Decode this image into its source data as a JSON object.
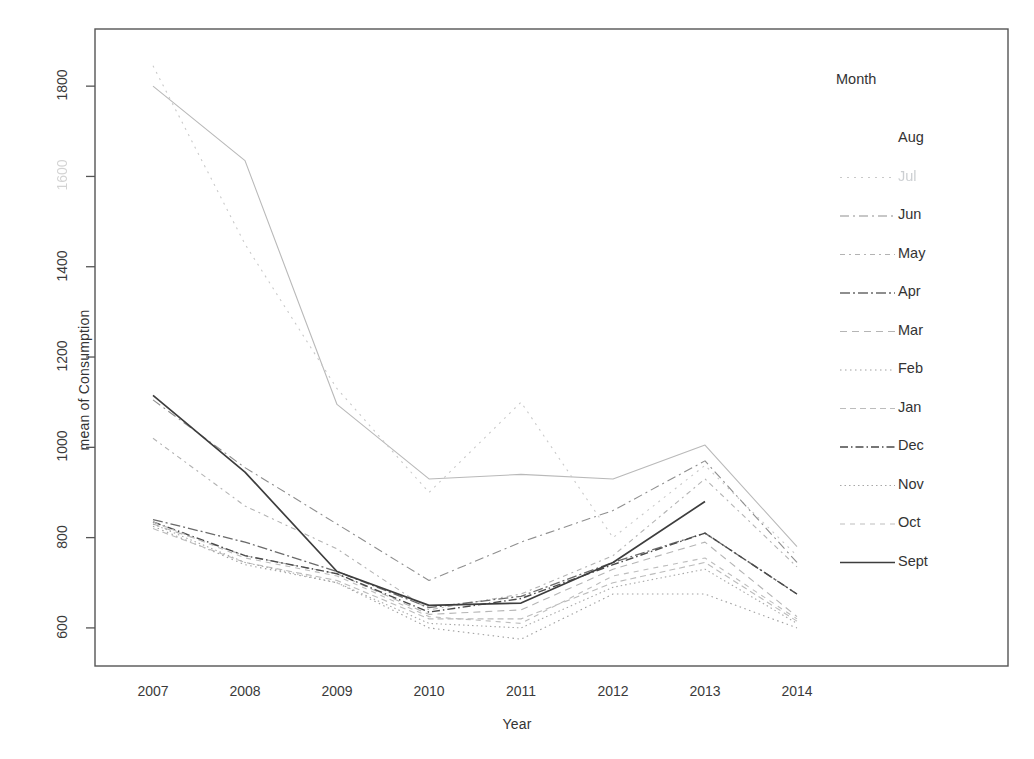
{
  "chart_data": {
    "type": "line",
    "title": "",
    "xlabel": "Year",
    "ylabel": "mean of  Consumption",
    "legend_title": "Month",
    "legend_position": "right",
    "grid": false,
    "categories": [
      "2007",
      "2008",
      "2009",
      "2010",
      "2011",
      "2012",
      "2013",
      "2014"
    ],
    "x": [
      2007,
      2008,
      2009,
      2010,
      2011,
      2012,
      2013,
      2014
    ],
    "xlim": [
      2006.5,
      2014.5
    ],
    "ylim": [
      540,
      1900
    ],
    "yticks": [
      600,
      800,
      1000,
      1200,
      1400,
      1600,
      1800
    ],
    "ytick_labels": [
      "600",
      "800",
      "1000",
      "1200",
      "1400",
      "1600",
      "1800"
    ],
    "series": [
      {
        "name": "Aug",
        "values": [
          1800,
          1635,
          1095,
          930,
          940,
          930,
          1005,
          780
        ],
        "dash": "none",
        "color": "#b9b9b9",
        "width": 1.1
      },
      {
        "name": "Jul",
        "values": [
          1845,
          1450,
          1130,
          900,
          1100,
          800,
          960,
          760
        ],
        "dash": "2 5",
        "color": "#c9c9c9",
        "width": 1.1
      },
      {
        "name": "Jun",
        "values": [
          1105,
          955,
          830,
          705,
          790,
          860,
          970,
          745
        ],
        "dash": "9 4 2 4",
        "color": "#8f8f8f",
        "width": 1.1
      },
      {
        "name": "May",
        "values": [
          1020,
          870,
          775,
          640,
          675,
          760,
          930,
          735
        ],
        "dash": "5 4 2 4",
        "color": "#b3b3b3",
        "width": 1.1
      },
      {
        "name": "Apr",
        "values": [
          840,
          790,
          725,
          645,
          670,
          745,
          810,
          675
        ],
        "dash": "10 3 2 3",
        "color": "#6a6a6a",
        "width": 1.3
      },
      {
        "name": "Mar",
        "values": [
          830,
          760,
          720,
          630,
          640,
          730,
          790,
          625
        ],
        "dash": "7 5",
        "color": "#b5b5b5",
        "width": 1.1
      },
      {
        "name": "Feb",
        "values": [
          825,
          740,
          700,
          600,
          575,
          675,
          675,
          600
        ],
        "dash": "1.5 3.5",
        "color": "#9f9f9f",
        "width": 1.1
      },
      {
        "name": "Jan",
        "values": [
          820,
          745,
          705,
          620,
          620,
          700,
          745,
          615
        ],
        "dash": "6 4",
        "color": "#bcbcbc",
        "width": 1.1
      },
      {
        "name": "Dec",
        "values": [
          835,
          760,
          720,
          635,
          665,
          740,
          810,
          675
        ],
        "dash": "8 3 1.5 3",
        "color": "#4a4a4a",
        "width": 1.4
      },
      {
        "name": "Nov",
        "values": [
          830,
          745,
          700,
          610,
          600,
          690,
          730,
          610
        ],
        "dash": "1.5 3",
        "color": "#a8a8a8",
        "width": 1.1
      },
      {
        "name": "Oct",
        "values": [
          835,
          755,
          715,
          625,
          610,
          715,
          755,
          620
        ],
        "dash": "5 5",
        "color": "#bdbdbd",
        "width": 1.1
      },
      {
        "name": "Sept",
        "values": [
          1115,
          945,
          725,
          650,
          655,
          745,
          880,
          null
        ],
        "dash": "none",
        "color": "#3d3d3d",
        "width": 1.7
      }
    ]
  },
  "legend": {
    "title": "Month",
    "entries": [
      {
        "label": "Aug",
        "show_key": false,
        "ghost": false
      },
      {
        "label": "Jul",
        "show_key": true,
        "ghost": true
      },
      {
        "label": "Jun",
        "show_key": true,
        "ghost": false
      },
      {
        "label": "May",
        "show_key": true,
        "ghost": false
      },
      {
        "label": "Apr",
        "show_key": true,
        "ghost": false
      },
      {
        "label": "Mar",
        "show_key": true,
        "ghost": false
      },
      {
        "label": "Feb",
        "show_key": true,
        "ghost": false
      },
      {
        "label": "Jan",
        "show_key": true,
        "ghost": false
      },
      {
        "label": "Dec",
        "show_key": true,
        "ghost": false
      },
      {
        "label": "Nov",
        "show_key": true,
        "ghost": false
      },
      {
        "label": "Oct",
        "show_key": true,
        "ghost": false
      },
      {
        "label": "Sept",
        "show_key": true,
        "ghost": false
      }
    ]
  },
  "axes": {
    "x_title": "Year",
    "y_title": "mean of  Consumption"
  },
  "colors": {
    "frame": "#555555",
    "text": "#333333",
    "background": "#ffffff"
  }
}
